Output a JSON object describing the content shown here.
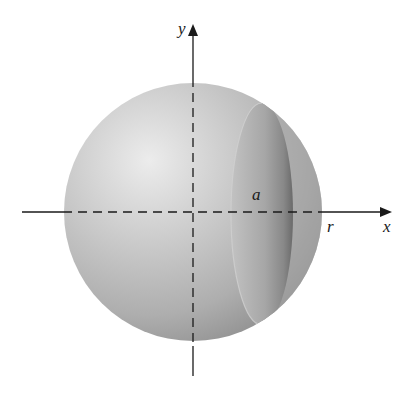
{
  "figure": {
    "labels": {
      "x_axis": "x",
      "y_axis": "y",
      "radius": "r",
      "cap_radius": "a"
    },
    "colors": {
      "background": "#ffffff",
      "sphere_light": "#e6e6e6",
      "sphere_mid": "#b4b4b4",
      "sphere_dark": "#8c8c8c",
      "cap_face": "#a9a9a9",
      "cap_shadow": "#6e6e6e",
      "axis": "#1a1a1a"
    }
  }
}
